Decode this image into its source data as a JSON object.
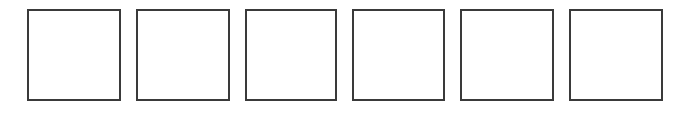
{
  "canvas": {
    "background": "#ffffff",
    "border_color": "#3a3a3a"
  },
  "boxes": [
    {
      "index": 1,
      "label": ""
    },
    {
      "index": 2,
      "label": ""
    },
    {
      "index": 3,
      "label": ""
    },
    {
      "index": 4,
      "label": ""
    },
    {
      "index": 5,
      "label": ""
    },
    {
      "index": 6,
      "label": ""
    }
  ]
}
